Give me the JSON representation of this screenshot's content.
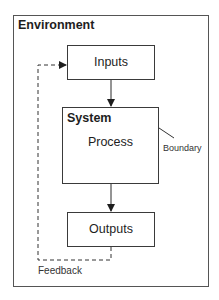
{
  "diagram": {
    "environment_label": "Environment",
    "system_label": "System",
    "nodes": {
      "inputs": "Inputs",
      "process": "Process",
      "outputs": "Outputs"
    },
    "annotations": {
      "boundary": "Boundary",
      "feedback": "Feedback"
    },
    "edges": [
      {
        "from": "Inputs",
        "to": "System",
        "style": "solid"
      },
      {
        "from": "System",
        "to": "Outputs",
        "style": "solid"
      },
      {
        "from": "Outputs",
        "to": "Inputs",
        "style": "dashed",
        "label": "Feedback"
      }
    ],
    "colors": {
      "stroke": "#3a3a3a",
      "background": "#ffffff"
    }
  }
}
